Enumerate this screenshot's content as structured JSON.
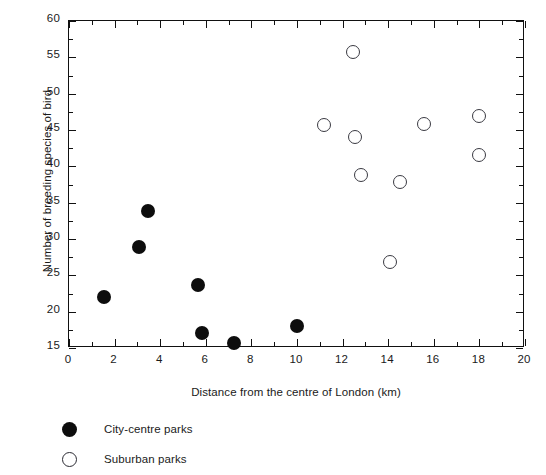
{
  "chart_data": {
    "type": "scatter",
    "title": "",
    "xlabel": "Distance from the centre of London (km)",
    "ylabel": "Number of breeding species of bird",
    "xlim": [
      0,
      20
    ],
    "ylim": [
      15,
      60
    ],
    "xticks": [
      0,
      2,
      4,
      6,
      8,
      10,
      12,
      14,
      16,
      18,
      20
    ],
    "xticklabels": [
      "0",
      "2",
      "4",
      "6",
      "8",
      "10",
      "12",
      "14",
      "16",
      "18",
      "20"
    ],
    "xminor_step": 1,
    "yticks": [
      15,
      20,
      25,
      30,
      35,
      40,
      45,
      50,
      55,
      60
    ],
    "yticklabels": [
      "15",
      "20",
      "25",
      "30",
      "35",
      "40",
      "45",
      "50",
      "55",
      "60"
    ],
    "yminor_step": 2.5,
    "grid": false,
    "legend_position": "below-left",
    "series": [
      {
        "name": "City-centre parks",
        "marker": "filled-circle",
        "color": "#0d0d0d",
        "points": [
          {
            "x": 1.55,
            "y": 22.0
          },
          {
            "x": 3.05,
            "y": 28.9
          },
          {
            "x": 3.45,
            "y": 33.9
          },
          {
            "x": 5.65,
            "y": 23.7
          },
          {
            "x": 5.85,
            "y": 17.0
          },
          {
            "x": 7.25,
            "y": 15.7
          },
          {
            "x": 10.0,
            "y": 18.0
          }
        ]
      },
      {
        "name": "Suburban parks",
        "marker": "open-circle",
        "color": "#3a3a42",
        "points": [
          {
            "x": 11.2,
            "y": 45.7
          },
          {
            "x": 12.45,
            "y": 55.7
          },
          {
            "x": 12.55,
            "y": 44.0
          },
          {
            "x": 12.8,
            "y": 38.8
          },
          {
            "x": 14.1,
            "y": 26.8
          },
          {
            "x": 14.5,
            "y": 37.8
          },
          {
            "x": 15.55,
            "y": 45.8
          },
          {
            "x": 18.0,
            "y": 46.9
          },
          {
            "x": 18.0,
            "y": 41.6
          }
        ]
      }
    ]
  },
  "legend": {
    "entries": [
      {
        "label": "City-centre parks",
        "marker": "filled-circle"
      },
      {
        "label": "Suburban parks",
        "marker": "open-circle"
      }
    ]
  }
}
